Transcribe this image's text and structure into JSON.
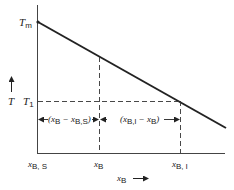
{
  "diagram": {
    "type": "phase-diagram-lever",
    "y_axis": {
      "label": "T",
      "arrow": "up"
    },
    "x_axis": {
      "label": "x",
      "label_sub": "B",
      "arrow": "right"
    },
    "y_ticks": [
      {
        "main": "T",
        "sub": "m"
      },
      {
        "main": "T",
        "sub": "1"
      }
    ],
    "x_ticks": [
      {
        "main": "x",
        "sub": "B, S"
      },
      {
        "main": "x",
        "sub": "B"
      },
      {
        "main": "x",
        "sub": "B, l"
      }
    ],
    "annotations": [
      {
        "text_a": "(x",
        "sub_a": "B",
        "mid": " − x",
        "sub_b": "B,S",
        "end": ")"
      },
      {
        "text_a": "(x",
        "sub_a": "B,l",
        "mid": " − x",
        "sub_b": "B",
        "end": ")"
      }
    ],
    "colors": {
      "line": "#222222",
      "dash": "#333333"
    }
  }
}
